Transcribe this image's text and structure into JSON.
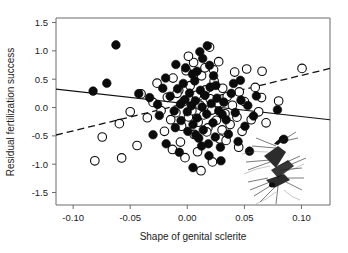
{
  "figure": {
    "plot_frame": {
      "left": 56,
      "top": 18,
      "right": 330,
      "bottom": 205
    }
  },
  "chart_data": {
    "type": "scatter",
    "title": "",
    "xlabel": "Shape of genital sclerite",
    "ylabel": "Residual fertilization success",
    "xlim": [
      -0.115,
      0.125
    ],
    "ylim": [
      -1.72,
      1.58
    ],
    "xticks": [
      -0.1,
      -0.05,
      0.0,
      0.05,
      0.1
    ],
    "xtick_labels": [
      "-0.10",
      "-0.05",
      "0.00",
      "0.05",
      "0.10"
    ],
    "yticks": [
      1.5,
      1.0,
      0.5,
      0.0,
      -0.5,
      -1.0,
      -1.5
    ],
    "ytick_labels": [
      "1.5",
      "1.0",
      "0.5",
      "0.0",
      "-0.5",
      "-1.0",
      "-1.5"
    ],
    "grid": false,
    "legend": "none",
    "marker_radius_px": 4.3,
    "series": [
      {
        "name": "filled-circles",
        "marker": "filled circle",
        "color": "#0b0b0b",
        "points": [
          [
            -0.0625,
            1.105
          ],
          [
            -0.0825,
            0.29
          ],
          [
            -0.0705,
            0.43
          ],
          [
            -0.0425,
            0.245
          ],
          [
            -0.033,
            0.175
          ],
          [
            -0.026,
            0.055
          ],
          [
            -0.0245,
            -0.14
          ],
          [
            -0.03,
            -0.48
          ],
          [
            -0.019,
            0.52
          ],
          [
            -0.015,
            0.2
          ],
          [
            -0.0115,
            -0.06
          ],
          [
            -0.0105,
            -0.355
          ],
          [
            -0.0085,
            0.33
          ],
          [
            -0.006,
            0.06
          ],
          [
            -0.0055,
            -0.23
          ],
          [
            -0.0035,
            0.425
          ],
          [
            -0.002,
            0.14
          ],
          [
            0.0,
            -0.075
          ],
          [
            0.0005,
            -0.42
          ],
          [
            0.002,
            0.255
          ],
          [
            0.0035,
            0.03
          ],
          [
            0.005,
            -0.3
          ],
          [
            0.0065,
            0.47
          ],
          [
            0.007,
            0.12
          ],
          [
            0.0085,
            -0.185
          ],
          [
            0.01,
            -0.54
          ],
          [
            0.0115,
            0.305
          ],
          [
            0.013,
            0.01
          ],
          [
            0.014,
            -0.395
          ],
          [
            0.0155,
            0.215
          ],
          [
            0.017,
            -0.115
          ],
          [
            0.0185,
            -0.64
          ],
          [
            0.02,
            0.36
          ],
          [
            0.021,
            0.07
          ],
          [
            0.0225,
            -0.27
          ],
          [
            0.0245,
            -0.52
          ],
          [
            0.026,
            0.165
          ],
          [
            0.0275,
            -0.06
          ],
          [
            0.029,
            -0.7
          ],
          [
            0.011,
            0.985
          ],
          [
            0.0175,
            1.09
          ],
          [
            0.0135,
            0.865
          ],
          [
            0.0195,
            0.745
          ],
          [
            0.0085,
            0.64
          ],
          [
            0.023,
            0.56
          ],
          [
            0.032,
            0.095
          ],
          [
            0.034,
            -0.215
          ],
          [
            0.036,
            -0.47
          ],
          [
            0.0385,
            0.25
          ],
          [
            0.042,
            -0.09
          ],
          [
            0.0445,
            -0.6
          ],
          [
            0.047,
            0.13
          ],
          [
            0.0505,
            -0.33
          ],
          [
            0.053,
            0.035
          ],
          [
            0.0545,
            -0.77
          ],
          [
            0.058,
            -0.15
          ],
          [
            0.0605,
            0.205
          ],
          [
            0.079,
            -0.04
          ],
          [
            0.0845,
            -0.56
          ],
          [
            0.0295,
            -0.94
          ],
          [
            0.019,
            -0.85
          ],
          [
            0.005,
            -1.06
          ],
          [
            -0.007,
            -0.79
          ],
          [
            0.0405,
            0.425
          ],
          [
            0.0465,
            0.48
          ],
          [
            -0.0015,
            0.7
          ],
          [
            -0.01,
            0.76
          ],
          [
            0.025,
            0.39
          ],
          [
            0.0045,
            0.59
          ],
          [
            -0.0215,
            0.34
          ],
          [
            0.0305,
            -0.12
          ],
          [
            0.0125,
            -0.68
          ],
          [
            -0.0185,
            -0.64
          ],
          [
            0.0075,
            -0.485
          ]
        ]
      },
      {
        "name": "open-circles",
        "marker": "open circle",
        "color": "#ffffff",
        "points": [
          [
            -0.081,
            -0.94
          ],
          [
            -0.0745,
            -0.52
          ],
          [
            -0.0595,
            -0.285
          ],
          [
            -0.05,
            -0.075
          ],
          [
            -0.0405,
            0.24
          ],
          [
            -0.035,
            -0.18
          ],
          [
            -0.03,
            0.09
          ],
          [
            -0.0265,
            0.43
          ],
          [
            -0.023,
            -0.055
          ],
          [
            -0.02,
            -0.42
          ],
          [
            -0.0175,
            0.18
          ],
          [
            -0.0145,
            -0.215
          ],
          [
            -0.0125,
            0.52
          ],
          [
            -0.01,
            -0.09
          ],
          [
            -0.0075,
            0.3
          ],
          [
            -0.005,
            -0.33
          ],
          [
            -0.003,
            0.11
          ],
          [
            -0.001,
            0.65
          ],
          [
            0.001,
            -0.165
          ],
          [
            0.0025,
            0.385
          ],
          [
            0.004,
            -0.055
          ],
          [
            0.006,
            -0.475
          ],
          [
            0.008,
            0.215
          ],
          [
            0.0095,
            -0.26
          ],
          [
            0.011,
            0.04
          ],
          [
            0.0125,
            0.56
          ],
          [
            0.0145,
            -0.13
          ],
          [
            0.016,
            0.31
          ],
          [
            0.018,
            -0.36
          ],
          [
            0.02,
            0.155
          ],
          [
            0.0215,
            -0.045
          ],
          [
            0.0235,
            0.465
          ],
          [
            0.0255,
            -0.225
          ],
          [
            0.027,
            0.085
          ],
          [
            0.0285,
            -0.555
          ],
          [
            0.031,
            0.34
          ],
          [
            0.033,
            -0.11
          ],
          [
            0.035,
            0.195
          ],
          [
            0.0375,
            -0.3
          ],
          [
            0.0395,
            0.04
          ],
          [
            0.0415,
            0.625
          ],
          [
            0.0435,
            -0.17
          ],
          [
            0.0455,
            0.275
          ],
          [
            0.048,
            -0.42
          ],
          [
            0.05,
            0.105
          ],
          [
            0.052,
            0.68
          ],
          [
            0.056,
            -0.215
          ],
          [
            0.0595,
            0.355
          ],
          [
            0.0625,
            -0.075
          ],
          [
            0.0655,
            0.64
          ],
          [
            0.08,
            0.115
          ],
          [
            0.1005,
            0.69
          ],
          [
            0.0155,
            0.7
          ],
          [
            0.023,
            0.665
          ],
          [
            0.0055,
            0.795
          ],
          [
            0.0275,
            0.81
          ],
          [
            -0.044,
            -0.67
          ],
          [
            -0.0575,
            -0.89
          ],
          [
            -0.006,
            -0.61
          ],
          [
            0.009,
            -0.78
          ],
          [
            0.034,
            -0.58
          ],
          [
            0.017,
            -0.43
          ],
          [
            0.045,
            -0.7
          ],
          [
            0.022,
            -0.96
          ],
          [
            0.012,
            -1.115
          ],
          [
            -0.002,
            -0.885
          ],
          [
            -0.013,
            -0.74
          ],
          [
            0.0305,
            -0.395
          ],
          [
            0.001,
            0.905
          ],
          [
            0.0195,
            1.065
          ],
          [
            -0.009,
            0.25
          ],
          [
            0.065,
            0.175
          ],
          [
            0.069,
            -0.27
          ]
        ]
      }
    ],
    "fit_lines": [
      {
        "name": "solid-regression-line",
        "style": "solid",
        "slope_sign": "negative",
        "x_start": -0.115,
        "y_start": 0.325,
        "x_end": 0.125,
        "y_end": -0.215
      },
      {
        "name": "dashed-regression-line",
        "style": "dashed",
        "slope_sign": "positive",
        "x_start": -0.115,
        "y_start": -0.485,
        "x_end": 0.125,
        "y_end": 0.69
      }
    ],
    "inset_illustration": {
      "name": "mating-insects-illustration",
      "description": "pair of mating insects (line drawing)",
      "x_center": 0.09,
      "y_center": -1.1
    }
  }
}
